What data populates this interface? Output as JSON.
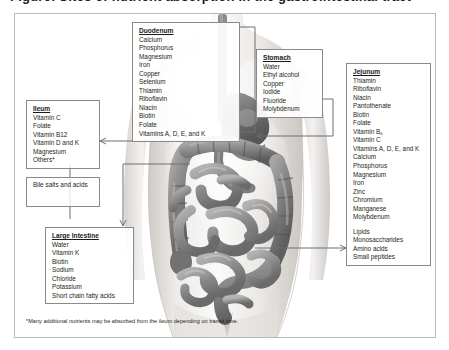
{
  "title_sliver": "Figure: Sites of nutrient absorption in the gastrointestinal tract",
  "frame": {
    "border_color": "#b9b9b9"
  },
  "boxes": {
    "duodenum": {
      "heading": "Duodenum",
      "items": [
        "Calcium",
        "Phosphorus",
        "Magnesium",
        "Iron",
        "Copper",
        "Selenium",
        "Thiamin",
        "Riboflavin",
        "Niacin",
        "Biotin",
        "Folate",
        "Vitamins A, D, E, and K"
      ]
    },
    "stomach": {
      "heading": "Stomach",
      "items": [
        "Water",
        "Ethyl alcohol",
        "Copper",
        "Iodide",
        "Fluoride",
        "Molybdenum"
      ]
    },
    "jejunum": {
      "heading": "Jejunum",
      "items": [
        "Thiamin",
        "Riboflavin",
        "Niacin",
        "Pantothenate",
        "Biotin",
        "Folate",
        "Vitamin B₆",
        "Vitamin C",
        "Vitamins A, D, E, and K",
        "Calcium",
        "Phosphorus",
        "Magnesium",
        "Iron",
        "Zinc",
        "Chromium",
        "Manganese",
        "Molybdenum"
      ],
      "items2": [
        "Lipids",
        "Monosaccharides",
        "Amino acids",
        "Small peptides"
      ]
    },
    "ileum": {
      "heading": "Ileum",
      "items": [
        "Vitamin C",
        "Folate",
        "Vitamin B12",
        "Vitamin D and K",
        "Magnesium",
        "Others*"
      ]
    },
    "bile": {
      "text": "Bile salts and acids"
    },
    "large_intestine": {
      "heading": "Large Intestine",
      "items": [
        "Water",
        "Vitamin K",
        "Biotin",
        "Sodium",
        "Chloride",
        "Potassium",
        "Short chain fatty acids"
      ]
    }
  },
  "footnote": "*Many additional nutrients may be absorbed from the ileum depending on transit time.",
  "colors": {
    "text": "#231f20",
    "line": "#6f6f6f",
    "box_border": "#8a8a8a",
    "frame_border": "#b9b9b9",
    "skin_light": "#f1efee",
    "skin_mid": "#dcd8d5",
    "organ_dark": "#6b6b6b",
    "organ_mid": "#9a9a9a"
  }
}
